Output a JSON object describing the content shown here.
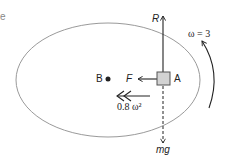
{
  "diagram": {
    "labels": {
      "reaction": "R",
      "friction": "F",
      "point_a": "A",
      "point_b": "B",
      "weight": "mg",
      "acceleration": "0.8 ω²",
      "angular_velocity": "ω = 3"
    },
    "partial_corner_text": "e",
    "colors": {
      "ellipse": "#9a9a9a",
      "lines": "#222222",
      "block_fill": "#d3d3d3",
      "block_stroke": "#555555"
    }
  }
}
